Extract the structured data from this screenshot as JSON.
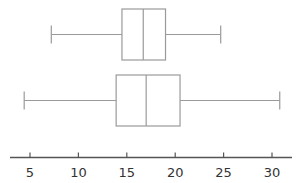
{
  "chart_data": {
    "type": "boxplot",
    "title": "",
    "xlabel": "",
    "ylabel": "",
    "xlim": [
      3,
      32.5
    ],
    "ticks": [
      5,
      10,
      15,
      20,
      25,
      30
    ],
    "tick_labels": [
      "5",
      "10",
      "15",
      "20",
      "25",
      "30"
    ],
    "grid": false,
    "legend": null,
    "series": [
      {
        "name": "upper",
        "min": 7.2,
        "q1": 14.5,
        "median": 16.7,
        "q3": 19.0,
        "max": 24.7
      },
      {
        "name": "lower",
        "min": 4.4,
        "q1": 13.9,
        "median": 17.0,
        "q3": 20.5,
        "max": 30.8
      }
    ],
    "colors": {
      "line": "#9a9a9a",
      "axis": "#555555",
      "text": "#333333"
    }
  }
}
